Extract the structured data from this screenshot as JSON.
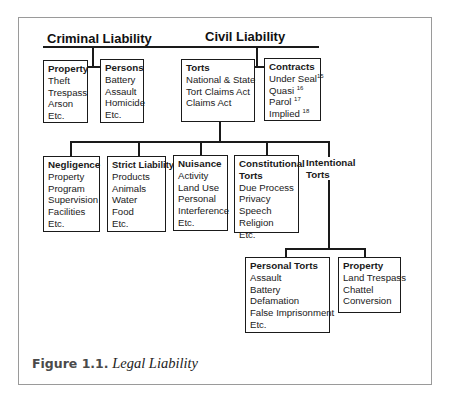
{
  "figure": {
    "caption_number": "Figure 1.1.",
    "caption_title": "Legal Liability"
  },
  "headers": {
    "criminal": "Criminal Liability",
    "civil": "Civil Liability"
  },
  "criminal": {
    "property": {
      "title": "Property",
      "items": [
        "Theft",
        "Trespass",
        "Arson",
        "Etc."
      ]
    },
    "persons": {
      "title": "Persons",
      "items": [
        "Battery",
        "Assault",
        "Homicide",
        "Etc."
      ]
    }
  },
  "civil": {
    "torts": {
      "title": "Torts",
      "items": [
        "National & State",
        "Tort Claims Act",
        "Claims Act"
      ]
    },
    "contracts": {
      "title": "Contracts",
      "items": [
        {
          "label": "Under Seal",
          "note": "15"
        },
        {
          "label": "Quasi",
          "note": "16"
        },
        {
          "label": "Parol",
          "note": "17"
        },
        {
          "label": "Implied",
          "note": "18"
        }
      ]
    }
  },
  "tort_types": {
    "negligence": {
      "title": "Negligence",
      "items": [
        "Property",
        "Program",
        "Supervision",
        "Facilities",
        "Etc."
      ]
    },
    "strict_liability": {
      "title": "Strict Liability",
      "items": [
        "Products",
        "Animals",
        "Water",
        "Food",
        "Etc."
      ]
    },
    "nuisance": {
      "title": "Nuisance",
      "items": [
        "Activity",
        "Land Use",
        "Personal",
        "Interference",
        "Etc."
      ]
    },
    "constitutional": {
      "title_line1": "Constitutional",
      "title_line2": "Torts",
      "items": [
        "Due Process",
        "Privacy",
        "Speech",
        "Religion",
        "Etc."
      ]
    },
    "intentional": {
      "title_line1": "Intentional",
      "title_line2": "Torts"
    }
  },
  "intentional_types": {
    "personal": {
      "title": "Personal Torts",
      "items": [
        "Assault",
        "Battery",
        "Defamation",
        "False Imprisonment",
        "Etc."
      ]
    },
    "property": {
      "title": "Property",
      "items": [
        "Land Trespass",
        "Chattel",
        "Conversion"
      ]
    }
  }
}
